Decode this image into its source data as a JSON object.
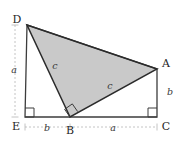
{
  "figure": {
    "background_color": "#ffffff",
    "shade_color": "#c9c9c9",
    "stroke_color": "#3c3c3c",
    "outline_color": "#2b2b2b",
    "guide_color": "#b5b5b5"
  },
  "vertices": {
    "D": {
      "label": "D",
      "x": 27,
      "y": 25,
      "label_x": 17,
      "label_y": 20
    },
    "A": {
      "label": "A",
      "x": 157,
      "y": 69,
      "label_x": 166,
      "label_y": 64
    },
    "E": {
      "label": "E",
      "x": 25,
      "y": 117,
      "label_x": 16,
      "label_y": 127
    },
    "B": {
      "label": "B",
      "x": 70,
      "y": 117,
      "label_x": 70,
      "label_y": 131
    },
    "C": {
      "label": "C",
      "x": 157,
      "y": 117,
      "label_x": 166,
      "label_y": 127
    }
  },
  "shaded_triangle": {
    "name": "triangle-DAB",
    "points": "27,25 157,69 70,117",
    "fill": "#c9c9c9"
  },
  "outline_paths": {
    "trapezoid": "M27,25 L25,117 L157,117 L157,69 Z",
    "triangle": "M27,25 L157,69 L70,117 Z"
  },
  "side_labels": [
    {
      "name": "label-a-left",
      "text": "a",
      "x": 14,
      "y": 73
    },
    {
      "name": "label-c-upper",
      "text": "c",
      "x": 55,
      "y": 69
    },
    {
      "name": "label-c-lower",
      "text": "c",
      "x": 110,
      "y": 89
    },
    {
      "name": "label-b-right",
      "text": "b",
      "x": 170,
      "y": 95
    },
    {
      "name": "label-b-bottom",
      "text": "b",
      "x": 47,
      "y": 131
    },
    {
      "name": "label-a-bottom",
      "text": "a",
      "x": 113,
      "y": 131
    }
  ],
  "right_angles": [
    {
      "name": "right-angle-E",
      "points": "25,108 34,108 34,117 25,117"
    },
    {
      "name": "right-angle-C",
      "points": "157,108 148,108 148,117 157,117"
    },
    {
      "name": "right-angle-B",
      "points": "70,117 64.6,109.3 72.3,103.9 77.7,111.6"
    }
  ],
  "guides": {
    "vertical": {
      "name": "guide-a-vertical",
      "x": 15,
      "y_top": 25,
      "y_bottom": 117,
      "tick_half": 3.5
    },
    "horizontal": {
      "name": "guide-base-horizontal",
      "y": 127,
      "x_left": 25,
      "x_mid": 70,
      "x_right": 157,
      "tick_half": 3.5
    }
  }
}
